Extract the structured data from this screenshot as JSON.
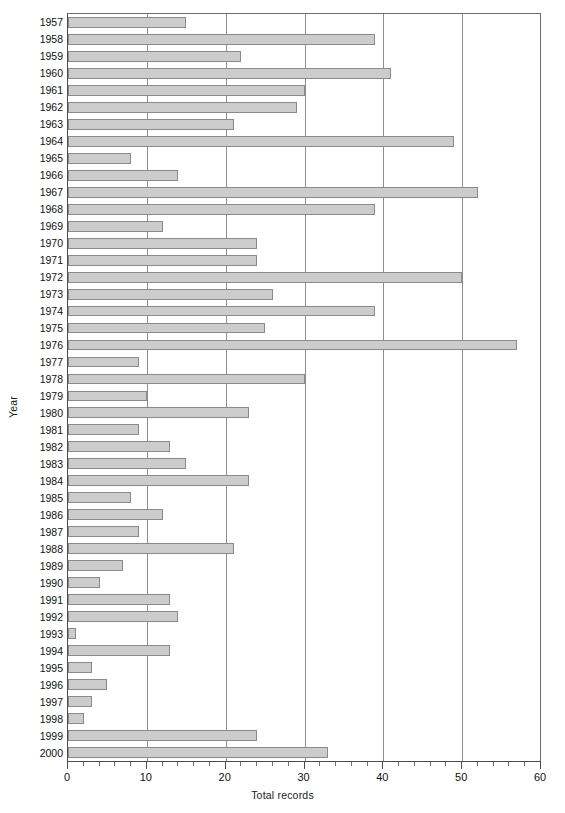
{
  "chart_data": {
    "type": "bar",
    "orientation": "horizontal",
    "title": "",
    "xlabel": "Total records",
    "ylabel": "Year",
    "xlim": [
      0,
      60
    ],
    "ylim": null,
    "grid": true,
    "legend": null,
    "x_major_ticks": [
      0,
      10,
      20,
      30,
      40,
      50,
      60
    ],
    "x_minor_tick_step": 2,
    "x_tick_labels": [
      "0",
      "10",
      "20",
      "30",
      "40",
      "50",
      "60"
    ],
    "bar_fill_color": "#cccccc",
    "bar_border_color": "#8a8a8a",
    "gridline_color": "#8e8e8e",
    "axis_color": "#4c4c4c",
    "categories": [
      "1957",
      "1958",
      "1959",
      "1960",
      "1961",
      "1962",
      "1963",
      "1964",
      "1965",
      "1966",
      "1967",
      "1968",
      "1969",
      "1970",
      "1971",
      "1972",
      "1973",
      "1974",
      "1975",
      "1976",
      "1977",
      "1978",
      "1979",
      "1980",
      "1981",
      "1982",
      "1983",
      "1984",
      "1985",
      "1986",
      "1987",
      "1988",
      "1989",
      "1990",
      "1991",
      "1992",
      "1993",
      "1994",
      "1995",
      "1996",
      "1997",
      "1998",
      "1999",
      "2000"
    ],
    "values": [
      15,
      39,
      22,
      41,
      30,
      29,
      21,
      49,
      8,
      14,
      52,
      39,
      12,
      24,
      24,
      50,
      26,
      39,
      25,
      57,
      9,
      30,
      10,
      23,
      9,
      13,
      15,
      23,
      8,
      12,
      9,
      21,
      7,
      4,
      13,
      14,
      1,
      13,
      3,
      5,
      3,
      2,
      24,
      33
    ]
  }
}
